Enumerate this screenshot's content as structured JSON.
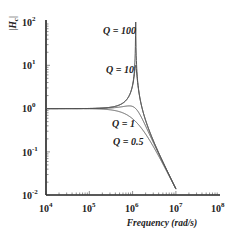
{
  "chart_data": {
    "type": "line",
    "title": "",
    "xlabel": "Frequency (rad/s)",
    "ylabel": "|H_c|",
    "xscale": "log",
    "yscale": "log",
    "xlim": [
      10000,
      100000000
    ],
    "ylim": [
      0.01,
      100
    ],
    "x_tick_labels": [
      "10^4",
      "10^5",
      "10^6",
      "10^7",
      "10^8"
    ],
    "y_tick_labels": [
      "10^-2",
      "10^-1",
      "10^0",
      "10^1",
      "10^2"
    ],
    "grid": false,
    "legend": "inline curve labels",
    "resonant_frequency": 1180000,
    "series": [
      {
        "name": "Q = 100",
        "Q": 100,
        "x": [
          10000,
          100000,
          500000,
          1000000,
          1180000,
          1500000,
          3000000,
          10000000
        ],
        "y": [
          1.0,
          1.01,
          1.33,
          3.5,
          100,
          1.25,
          0.18,
          0.014
        ]
      },
      {
        "name": "Q = 10",
        "Q": 10,
        "x": [
          10000,
          100000,
          500000,
          1000000,
          1180000,
          1500000,
          3000000,
          10000000
        ],
        "y": [
          1.0,
          1.01,
          1.3,
          3.2,
          10,
          1.6,
          0.18,
          0.014
        ]
      },
      {
        "name": "Q = 1",
        "Q": 1,
        "x": [
          10000,
          100000,
          500000,
          1000000,
          1180000,
          1500000,
          3000000,
          10000000
        ],
        "y": [
          1.0,
          1.0,
          1.08,
          1.05,
          1.0,
          0.78,
          0.17,
          0.014
        ]
      },
      {
        "name": "Q = 0.5",
        "Q": 0.5,
        "x": [
          10000,
          100000,
          500000,
          1000000,
          1180000,
          1500000,
          3000000,
          10000000
        ],
        "y": [
          1.0,
          0.98,
          0.84,
          0.58,
          0.5,
          0.38,
          0.13,
          0.013
        ]
      }
    ],
    "annotations": [
      "Q = 100",
      "Q = 10",
      "Q = 1",
      "Q = 0.5"
    ]
  },
  "axes": {
    "ylabel_main": "|H",
    "ylabel_sub": "c",
    "ylabel_end": "|",
    "xlabel": "Frequency (rad/s)",
    "xticks": [
      {
        "base": "10",
        "exp": "4"
      },
      {
        "base": "10",
        "exp": "5"
      },
      {
        "base": "10",
        "exp": "6"
      },
      {
        "base": "10",
        "exp": "7"
      },
      {
        "base": "10",
        "exp": "8"
      }
    ],
    "yticks": [
      {
        "base": "10",
        "exp": "2"
      },
      {
        "base": "10",
        "exp": "1"
      },
      {
        "base": "10",
        "exp": "0"
      },
      {
        "base": "10",
        "exp": "-1"
      },
      {
        "base": "10",
        "exp": "-2"
      }
    ]
  },
  "labels": {
    "q100": "Q = 100",
    "q10": "Q = 10",
    "q1": "Q = 1",
    "q05": "Q = 0.5"
  },
  "colors": {
    "axis": "#222222",
    "curve": "#555555"
  }
}
